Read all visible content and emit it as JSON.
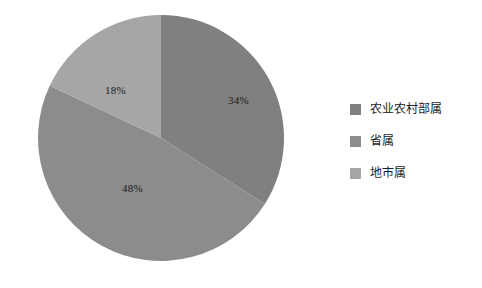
{
  "chart_data": {
    "type": "pie",
    "title": "",
    "categories": [
      "农业农村部属",
      "省属",
      "地市属"
    ],
    "values": [
      34,
      48,
      18
    ],
    "labels": [
      "34%",
      "18%",
      "48%"
    ],
    "units": "%",
    "start_angle_deg": 0,
    "direction": "clockwise",
    "colors": [
      "#808080",
      "#8c8c8c",
      "#a6a6a6"
    ],
    "legend_position": "right",
    "grid": false,
    "slices": [
      {
        "name": "农业农村部属",
        "value": 34,
        "label": "34%",
        "color": "#808080"
      },
      {
        "name": "省属",
        "value": 48,
        "label": "48%",
        "color": "#8c8c8c"
      },
      {
        "name": "地市属",
        "value": 18,
        "label": "18%",
        "color": "#a6a6a6"
      }
    ]
  },
  "pie": {
    "label_34": "34%",
    "label_18": "18%",
    "label_48": "48%"
  },
  "legend": {
    "items": [
      {
        "label": "农业农村部属",
        "color": "#808080"
      },
      {
        "label": "省属",
        "color": "#8c8c8c"
      },
      {
        "label": "地市属",
        "color": "#a6a6a6"
      }
    ]
  }
}
